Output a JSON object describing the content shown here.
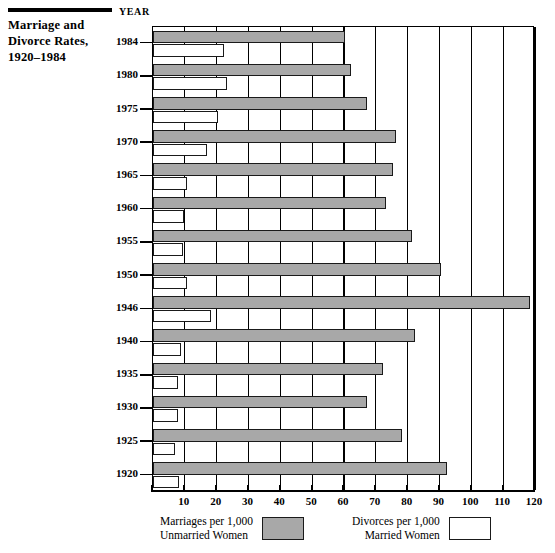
{
  "title": {
    "lines": [
      "Marriage and",
      "Divorce Rates,",
      "1920–1984"
    ]
  },
  "axis": {
    "year_caption": "YEAR",
    "x_ticks": [
      "10",
      "20",
      "30",
      "40",
      "50",
      "60",
      "70",
      "80",
      "90",
      "100",
      "110",
      "120"
    ],
    "x_tick_values": [
      10,
      20,
      30,
      40,
      50,
      60,
      70,
      80,
      90,
      100,
      110,
      120
    ]
  },
  "legend": {
    "marriage": {
      "line1": "Marriages per 1,000",
      "line2": "Unmarried Women",
      "color": "#a8a8a8"
    },
    "divorce": {
      "line1": "Divorces per 1,000",
      "line2": "Married Women",
      "color": "#ffffff"
    }
  },
  "chart_data": {
    "type": "bar",
    "orientation": "horizontal",
    "title": "Marriage and Divorce Rates, 1920–1984",
    "xlabel": "",
    "ylabel": "YEAR",
    "xlim": [
      0,
      120
    ],
    "grid": true,
    "legend_position": "bottom",
    "categories": [
      "1984",
      "1980",
      "1975",
      "1970",
      "1965",
      "1960",
      "1955",
      "1950",
      "1946",
      "1940",
      "1935",
      "1930",
      "1925",
      "1920"
    ],
    "series": [
      {
        "name": "Marriages per 1,000 Unmarried Women",
        "color": "#a8a8a8",
        "values": [
          60,
          62,
          67,
          76,
          75,
          73,
          81,
          90,
          118,
          82,
          72,
          67,
          78,
          92
        ]
      },
      {
        "name": "Divorces per 1,000 Married Women",
        "color": "#ffffff",
        "values": [
          22,
          23,
          20,
          16.5,
          10.5,
          9.5,
          9,
          10.5,
          18,
          8.5,
          7.5,
          7.5,
          6.5,
          8
        ]
      }
    ]
  }
}
